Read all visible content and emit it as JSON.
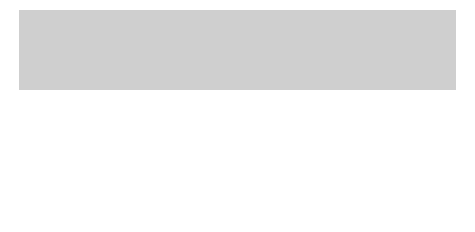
{
  "diagram": {
    "left_title": "Subscriber",
    "right_title": "Local exchange",
    "wdm_left_label": "W",
    "wdm_right_label": "W",
    "transducers": {
      "left_top": {
        "top": "e",
        "bottom": "o"
      },
      "left_bottom": {
        "top": "e",
        "bottom": "o"
      },
      "right_top": {
        "top": "o",
        "bottom": "e"
      },
      "right_bottom": {
        "top": "o",
        "bottom": "e"
      }
    },
    "wavelength_labels": {
      "left_top": "λ1",
      "left_bottom": "λ2",
      "right_top": "λ1",
      "right_bottom": "λ2"
    },
    "icons": {
      "subscriber": "telephone-icon",
      "exchange": "switch-matrix-icon"
    },
    "colors": {
      "panel_bg": "#cfcfcf",
      "box_fill": "#ffffff",
      "stroke": "#222222"
    }
  },
  "legend": {
    "left": [
      {
        "key": "e/o",
        "value": "Optoelectronic transducer"
      },
      {
        "key": "λ",
        "value": "Optical wavelength"
      }
    ],
    "right": [
      {
        "key": "o/e",
        "value": "Optoelectronic transducer"
      },
      {
        "key": "W",
        "value": "Wavelength division multiplexer"
      }
    ]
  }
}
